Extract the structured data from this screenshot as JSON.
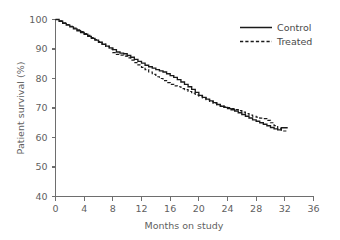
{
  "chart_data": {
    "type": "line",
    "title": "",
    "xlabel": "Months on study",
    "ylabel": "Patient survival (%)",
    "xlim": [
      0,
      36
    ],
    "ylim": [
      40,
      100
    ],
    "xticks": [
      0,
      4,
      8,
      12,
      16,
      20,
      24,
      28,
      32,
      36
    ],
    "xtick_labels": [
      "0",
      "4",
      "8",
      "12",
      "16",
      "20",
      "24",
      "28",
      "32",
      "36"
    ],
    "yticks": [
      40,
      50,
      60,
      70,
      80,
      90,
      100
    ],
    "ytick_labels": [
      "40",
      "50",
      "60",
      "70",
      "80",
      "90",
      "100"
    ],
    "grid": false,
    "legend_position": "top-right",
    "legend": [
      "Control",
      "Treated"
    ],
    "colors": {
      "control": "#1a1a1a",
      "treated": "#1a1a1a",
      "axis": "#6e6e6e",
      "text": "#5f5f5f",
      "background": "#ffffff"
    },
    "series": [
      {
        "name": "Control",
        "style": "solid",
        "x": [
          0,
          0.5,
          1,
          1.5,
          2,
          2.5,
          3,
          3.5,
          4,
          4.5,
          5,
          5.5,
          6,
          6.5,
          7,
          7.5,
          8,
          8.5,
          9,
          9.5,
          10,
          10.5,
          11,
          11.5,
          12,
          12.5,
          13,
          13.5,
          14,
          14.5,
          15,
          15.5,
          16,
          16.5,
          17,
          17.5,
          18,
          18.5,
          19,
          19.5,
          20,
          20.5,
          21,
          21.5,
          22,
          22.5,
          23,
          23.5,
          24,
          24.5,
          25,
          25.5,
          26,
          26.5,
          27,
          27.5,
          28,
          28.5,
          29,
          29.5,
          30,
          30.5,
          31,
          31.5,
          32,
          32.4
        ],
        "values": [
          100,
          99.4,
          98.7,
          98.1,
          97.5,
          96.8,
          96.2,
          95.6,
          95.0,
          94.3,
          93.6,
          93.0,
          92.3,
          91.6,
          91.0,
          90.4,
          89.8,
          89.0,
          88.6,
          88.4,
          87.8,
          87.2,
          86.5,
          85.8,
          85.2,
          84.5,
          84.0,
          83.5,
          83.0,
          82.6,
          82.2,
          81.6,
          81.0,
          80.4,
          79.6,
          78.8,
          78.0,
          77.2,
          76.3,
          75.3,
          74.3,
          73.6,
          73.0,
          72.4,
          71.8,
          71.2,
          70.6,
          70.2,
          69.8,
          69.4,
          69.0,
          68.4,
          67.8,
          67.2,
          66.6,
          66.0,
          65.5,
          65.0,
          64.5,
          64.0,
          63.4,
          62.9,
          62.6,
          63.3,
          63.3,
          63.3
        ]
      },
      {
        "name": "Treated",
        "style": "dashed",
        "x": [
          0,
          0.5,
          1,
          1.5,
          2,
          2.5,
          3,
          3.5,
          4,
          4.5,
          5,
          5.5,
          6,
          6.5,
          7,
          7.5,
          8,
          8.5,
          9,
          9.5,
          10,
          10.5,
          11,
          11.5,
          12,
          12.5,
          13,
          13.5,
          14,
          14.5,
          15,
          15.5,
          16,
          16.5,
          17,
          17.5,
          18,
          18.5,
          19,
          19.5,
          20,
          20.5,
          21,
          21.5,
          22,
          22.5,
          23,
          23.5,
          24,
          24.5,
          25,
          25.5,
          26,
          26.5,
          27,
          27.5,
          28,
          28.5,
          29,
          29.5,
          30,
          30.5,
          31,
          31.5,
          32,
          32.4
        ],
        "values": [
          100,
          99.5,
          98.9,
          98.3,
          97.7,
          97.1,
          96.5,
          95.9,
          95.2,
          94.6,
          93.9,
          93.2,
          92.5,
          91.7,
          90.9,
          90.0,
          88.8,
          88.2,
          87.9,
          87.6,
          87.0,
          86.2,
          85.4,
          84.6,
          83.8,
          83.0,
          82.2,
          81.4,
          80.6,
          80.0,
          79.3,
          78.6,
          78.0,
          77.5,
          77.2,
          76.6,
          76.2,
          75.6,
          75.0,
          74.4,
          74.0,
          73.4,
          72.8,
          72.2,
          71.6,
          71.1,
          70.7,
          70.4,
          70.1,
          69.8,
          69.5,
          69.1,
          68.6,
          68.1,
          67.6,
          67.2,
          66.9,
          66.6,
          66.4,
          65.8,
          65.0,
          64.0,
          63.0,
          62.2,
          62.2,
          62.2
        ]
      }
    ]
  },
  "legend": {
    "items": [
      {
        "label": "Control",
        "style": "solid"
      },
      {
        "label": "Treated",
        "style": "dashed"
      }
    ]
  },
  "axes": {
    "x_title": "Months on study",
    "y_title": "Patient survival (%)"
  }
}
